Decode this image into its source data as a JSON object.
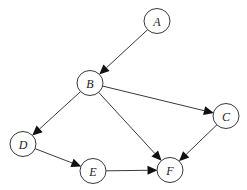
{
  "diagram": {
    "type": "directed-graph",
    "width": 247,
    "height": 190,
    "node_radius": 12.5,
    "nodes": [
      {
        "id": "A",
        "label": "A",
        "x": 157,
        "y": 21
      },
      {
        "id": "B",
        "label": "B",
        "x": 90,
        "y": 83
      },
      {
        "id": "C",
        "label": "C",
        "x": 226,
        "y": 116
      },
      {
        "id": "D",
        "label": "D",
        "x": 23,
        "y": 144
      },
      {
        "id": "E",
        "label": "E",
        "x": 93,
        "y": 171
      },
      {
        "id": "F",
        "label": "F",
        "x": 170,
        "y": 170
      }
    ],
    "edges": [
      {
        "from": "A",
        "to": "B"
      },
      {
        "from": "B",
        "to": "C"
      },
      {
        "from": "B",
        "to": "D"
      },
      {
        "from": "B",
        "to": "F"
      },
      {
        "from": "C",
        "to": "F"
      },
      {
        "from": "D",
        "to": "E"
      },
      {
        "from": "E",
        "to": "F"
      }
    ],
    "colors": {
      "background": "#ffffff",
      "node_stroke": "#3a3a3a",
      "edge": "#3a3a3a",
      "arrowhead": "#111111"
    }
  }
}
